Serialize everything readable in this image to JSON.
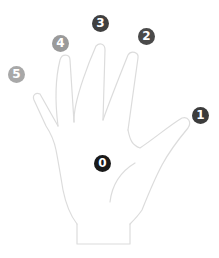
{
  "diagram": {
    "outline_color": "#dcdcdc",
    "labels": [
      {
        "id": "palm",
        "text": "0",
        "color": "#1a1a1a",
        "x": 94,
        "y": 155
      },
      {
        "id": "thumb",
        "text": "1",
        "color": "#3c3c3c",
        "x": 192,
        "y": 107
      },
      {
        "id": "index",
        "text": "2",
        "color": "#4a4a4a",
        "x": 138,
        "y": 28
      },
      {
        "id": "middle",
        "text": "3",
        "color": "#404040",
        "x": 92,
        "y": 15
      },
      {
        "id": "ring",
        "text": "4",
        "color": "#9a9a9a",
        "x": 52,
        "y": 35
      },
      {
        "id": "pinky",
        "text": "5",
        "color": "#a8a8a8",
        "x": 8,
        "y": 66
      }
    ]
  }
}
